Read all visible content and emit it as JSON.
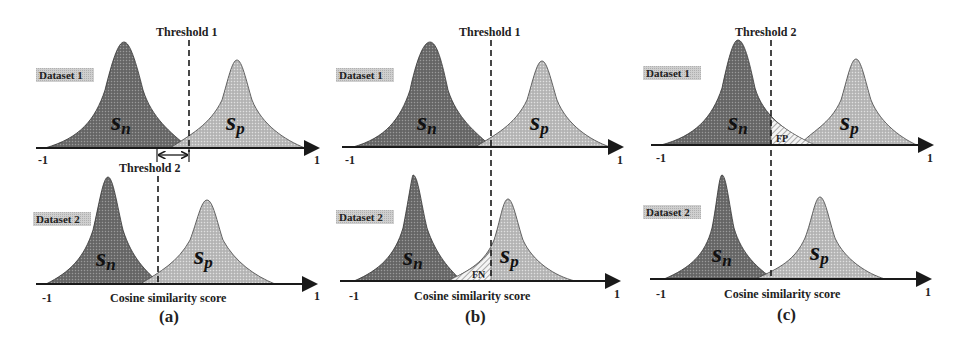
{
  "figure": {
    "panels": [
      {
        "id": "a",
        "caption": "(a)",
        "top": {
          "dataset_label": "Dataset 1",
          "threshold_label": "Threshold 1",
          "neg_label": "s",
          "neg_sub": "n",
          "pos_label": "s",
          "pos_sub": "p",
          "tick_min": "-1",
          "tick_max": "1"
        },
        "bottom": {
          "dataset_label": "Dataset 2",
          "threshold_label": "Threshold 2",
          "neg_label": "s",
          "neg_sub": "n",
          "pos_label": "s",
          "pos_sub": "p",
          "tick_min": "-1",
          "tick_max": "1",
          "xlabel": "Cosine similarity score"
        }
      },
      {
        "id": "b",
        "caption": "(b)",
        "top": {
          "dataset_label": "Dataset 1",
          "threshold_label": "Threshold 1",
          "neg_label": "s",
          "neg_sub": "n",
          "pos_label": "s",
          "pos_sub": "p",
          "tick_min": "-1",
          "tick_max": "1"
        },
        "bottom": {
          "dataset_label": "Dataset 2",
          "neg_label": "s",
          "neg_sub": "n",
          "pos_label": "s",
          "pos_sub": "p",
          "error_label": "FN",
          "tick_min": "-1",
          "tick_max": "1",
          "xlabel": "Cosine similarity score"
        }
      },
      {
        "id": "c",
        "caption": "(c)",
        "top": {
          "dataset_label": "Dataset 1",
          "threshold_label": "Threshold 2",
          "neg_label": "s",
          "neg_sub": "n",
          "pos_label": "s",
          "pos_sub": "p",
          "error_label": "FP",
          "tick_min": "-1",
          "tick_max": "1"
        },
        "bottom": {
          "dataset_label": "Dataset 2",
          "neg_label": "s",
          "neg_sub": "n",
          "pos_label": "s",
          "pos_sub": "p",
          "tick_min": "-1",
          "tick_max": "1",
          "xlabel": "Cosine similarity score"
        }
      }
    ],
    "colors": {
      "negative_fill": "#7a7a7a",
      "positive_fill": "#bdbdbd",
      "label_bg": "#c8c8c8",
      "axis": "#1a1a1a"
    }
  }
}
